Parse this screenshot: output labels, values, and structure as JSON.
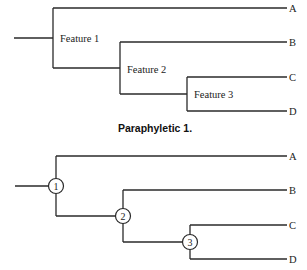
{
  "top_tree": {
    "caption": "Paraphyletic 1.",
    "features": [
      "Feature 1",
      "Feature 2",
      "Feature 3"
    ],
    "leaves": [
      "A",
      "B",
      "C",
      "D"
    ]
  },
  "bottom_tree": {
    "nodes": [
      "1",
      "2",
      "3"
    ],
    "leaves": [
      "A",
      "B",
      "C",
      "D"
    ]
  }
}
